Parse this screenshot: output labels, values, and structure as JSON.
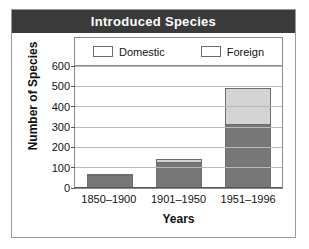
{
  "chart_data": {
    "type": "bar",
    "title": "Introduced Species",
    "xlabel": "Years",
    "ylabel": "Number of Species",
    "categories": [
      "1850–1900",
      "1901–1950",
      "1951–1996"
    ],
    "series": [
      {
        "name": "Domestic",
        "values": [
          62,
          130,
          315
        ],
        "color": "#777777"
      },
      {
        "name": "Foreign",
        "values": [
          8,
          15,
          175
        ],
        "color": "#d4d4d4"
      }
    ],
    "stacked": true,
    "totals": [
      70,
      145,
      490
    ],
    "ylim": [
      0,
      600
    ],
    "yticks": [
      0,
      100,
      200,
      300,
      400,
      500,
      600
    ],
    "ytick_labels": [
      "0",
      "100",
      "200",
      "300",
      "400",
      "500",
      "600"
    ],
    "grid": true,
    "legend_position": "top-inside"
  },
  "style": {
    "title_bg": "#3a3a3a",
    "title_fg": "#ffffff",
    "frame": "#9a9a9a",
    "grid_color": "#b9b9b9"
  }
}
